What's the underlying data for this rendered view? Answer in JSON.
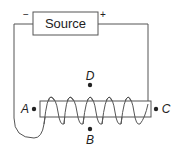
{
  "diagram": {
    "source": {
      "label": "Source",
      "negative_terminal": "−",
      "positive_terminal": "+"
    },
    "points": [
      {
        "id": "A",
        "label": "A"
      },
      {
        "id": "B",
        "label": "B"
      },
      {
        "id": "C",
        "label": "C"
      },
      {
        "id": "D",
        "label": "D"
      }
    ],
    "colors": {
      "line": "#555555",
      "text": "#222222"
    }
  }
}
